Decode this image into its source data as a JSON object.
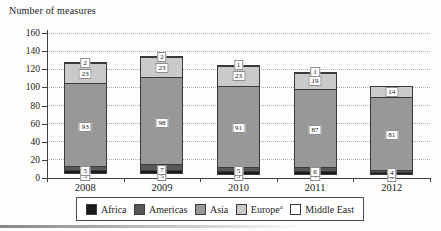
{
  "title": "Number of measures",
  "y_axis": {
    "labels": [
      "0",
      "20",
      "40",
      "60",
      "80",
      "100",
      "120",
      "140",
      "160"
    ],
    "min": 0,
    "max": 160,
    "step": 20
  },
  "legend": {
    "items": [
      {
        "label": "Africa",
        "sup": "",
        "color": "#1a1a1a"
      },
      {
        "label": "Americas",
        "sup": "",
        "color": "#575757"
      },
      {
        "label": "Asia",
        "sup": "",
        "color": "#989898"
      },
      {
        "label": "Europe",
        "sup": "a",
        "color": "#cacaca"
      },
      {
        "label": "Middle East",
        "sup": "",
        "color": "#ffffff"
      }
    ]
  },
  "chart_data": {
    "type": "bar",
    "stacked": true,
    "title": "Number of measures",
    "xlabel": "",
    "ylabel": "Number of measures",
    "ylim": [
      0,
      160
    ],
    "grid": "dotted-horizontal",
    "legend_position": "bottom",
    "categories": [
      "2008",
      "2009",
      "2010",
      "2011",
      "2012"
    ],
    "series": [
      {
        "name": "Africa",
        "color": "#1a1a1a",
        "values": [
          5,
          5,
          5,
          4,
          3
        ],
        "data_labels": [
          "5",
          "5",
          "5",
          "4",
          "3"
        ]
      },
      {
        "name": "Americas",
        "color": "#575757",
        "values": [
          5,
          7,
          5,
          6,
          4
        ],
        "data_labels": [
          "5",
          "7",
          "5",
          "6",
          "4"
        ]
      },
      {
        "name": "Asia",
        "color": "#989898",
        "values": [
          93,
          98,
          91,
          87,
          81
        ],
        "data_labels": [
          "93",
          "98",
          "91",
          "87",
          "81"
        ]
      },
      {
        "name": "Europe",
        "color": "#cacaca",
        "values": [
          23,
          23,
          23,
          19,
          14
        ],
        "data_labels": [
          "23",
          "23",
          "23",
          "19",
          "14"
        ]
      },
      {
        "name": "Middle East",
        "color": "#ffffff",
        "values": [
          2,
          2,
          1,
          1,
          0
        ],
        "data_labels": [
          "2",
          "2",
          "1",
          "1",
          ""
        ]
      }
    ],
    "totals": [
      128,
      135,
      125,
      117,
      102
    ]
  }
}
